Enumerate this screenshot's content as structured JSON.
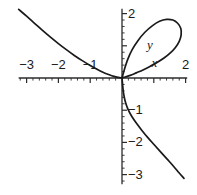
{
  "figure": {
    "background_color": "#ffffff",
    "curve_color": "#1a1a1a",
    "axis_color": "#2b2b2b"
  },
  "chart_data": {
    "type": "line",
    "title": "",
    "subtitle": "",
    "xlabel": "x",
    "ylabel": "y",
    "xlim": [
      -3.25,
      2.05
    ],
    "ylim": [
      -3.3,
      2.15
    ],
    "grid": false,
    "legend": null,
    "axis_names": {
      "x": "x",
      "y": "y"
    },
    "x_ticks": [
      {
        "value": -3,
        "label": "−3"
      },
      {
        "value": -2,
        "label": "−2"
      },
      {
        "value": -1,
        "label": "−1"
      },
      {
        "value": 1,
        "label": ""
      },
      {
        "value": 2,
        "label": "2"
      }
    ],
    "y_ticks": [
      {
        "value": 2,
        "label": "2"
      },
      {
        "value": 1,
        "label": ""
      },
      {
        "value": -1,
        "label": "−1"
      },
      {
        "value": -2,
        "label": "−2"
      },
      {
        "value": -3,
        "label": "−3"
      }
    ],
    "minor_tick_step": 0.2,
    "annotations": [
      {
        "text": "y",
        "x": 0.88,
        "y": 1.02,
        "style": "italic"
      },
      {
        "text": "x",
        "x": 1.02,
        "y": 0.48,
        "style": "italic"
      }
    ],
    "series": [
      {
        "name": "folium-branch-upper-left",
        "description": "asymptotic branch descending from upper left toward origin",
        "points": [
          [
            -3.25,
            2.13
          ],
          [
            -3.0,
            1.92
          ],
          [
            -2.75,
            1.7
          ],
          [
            -2.5,
            1.48
          ],
          [
            -2.25,
            1.27
          ],
          [
            -2.0,
            1.07
          ],
          [
            -1.75,
            0.88
          ],
          [
            -1.5,
            0.7
          ],
          [
            -1.25,
            0.54
          ],
          [
            -1.0,
            0.39
          ],
          [
            -0.8,
            0.28
          ],
          [
            -0.6,
            0.18
          ],
          [
            -0.4,
            0.1
          ],
          [
            -0.25,
            0.05
          ],
          [
            -0.12,
            0.02
          ],
          [
            0,
            0
          ]
        ]
      },
      {
        "name": "folium-loop",
        "description": "closed loop in the first quadrant returning to the origin",
        "points": [
          [
            0,
            0
          ],
          [
            0.08,
            0.28
          ],
          [
            0.18,
            0.58
          ],
          [
            0.32,
            0.88
          ],
          [
            0.5,
            1.16
          ],
          [
            0.72,
            1.42
          ],
          [
            0.95,
            1.62
          ],
          [
            1.18,
            1.76
          ],
          [
            1.4,
            1.82
          ],
          [
            1.6,
            1.8
          ],
          [
            1.75,
            1.7
          ],
          [
            1.85,
            1.54
          ],
          [
            1.86,
            1.34
          ],
          [
            1.8,
            1.14
          ],
          [
            1.68,
            0.95
          ],
          [
            1.52,
            0.78
          ],
          [
            1.32,
            0.62
          ],
          [
            1.1,
            0.48
          ],
          [
            0.88,
            0.36
          ],
          [
            0.66,
            0.25
          ],
          [
            0.45,
            0.16
          ],
          [
            0.26,
            0.08
          ],
          [
            0.1,
            0.03
          ],
          [
            0,
            0
          ]
        ]
      },
      {
        "name": "folium-branch-lower-right",
        "description": "branch descending from origin to the lower right",
        "points": [
          [
            0,
            0
          ],
          [
            0.02,
            -0.22
          ],
          [
            0.05,
            -0.48
          ],
          [
            0.1,
            -0.72
          ],
          [
            0.18,
            -0.95
          ],
          [
            0.3,
            -1.18
          ],
          [
            0.45,
            -1.4
          ],
          [
            0.62,
            -1.62
          ],
          [
            0.82,
            -1.86
          ],
          [
            1.02,
            -2.08
          ],
          [
            1.22,
            -2.3
          ],
          [
            1.42,
            -2.52
          ],
          [
            1.62,
            -2.74
          ],
          [
            1.8,
            -2.95
          ],
          [
            1.95,
            -3.12
          ]
        ]
      }
    ]
  }
}
